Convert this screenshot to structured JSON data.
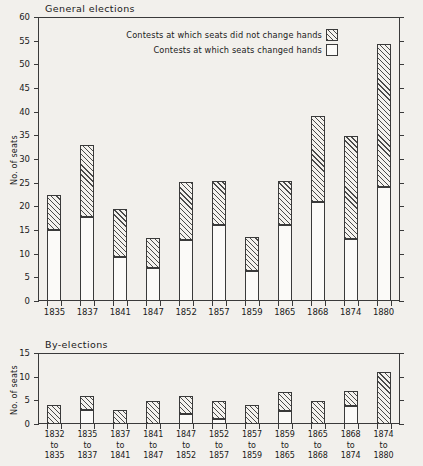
{
  "figure": {
    "background_color": "#f2f0ec",
    "ink_color": "#1a1a1a"
  },
  "legend": {
    "items": [
      {
        "label": "Contests at which seats did not change hands",
        "key": "hatched"
      },
      {
        "label": "Contests at which seats changed hands",
        "key": "open"
      }
    ]
  },
  "chart_data": [
    {
      "type": "bar",
      "subtype": "stacked",
      "title": "General elections",
      "xlabel": "",
      "ylabel": "No. of seats",
      "ylim": [
        0,
        60
      ],
      "yticks": [
        0,
        5,
        10,
        15,
        20,
        25,
        30,
        35,
        40,
        45,
        50,
        55,
        60
      ],
      "ytick_labels": [
        "0",
        "5",
        "10",
        "15",
        "20",
        "25",
        "30",
        "35",
        "40",
        "45",
        "50",
        "55",
        "60"
      ],
      "grid": false,
      "legend_position": "upper center",
      "categories": [
        "1835",
        "1837",
        "1841",
        "1847",
        "1852",
        "1857",
        "1859",
        "1865",
        "1868",
        "1874",
        "1880"
      ],
      "series": [
        {
          "name": "Contests at which seats changed hands",
          "style": "open",
          "values": [
            15,
            17.8,
            9.2,
            7,
            12.8,
            16,
            6.3,
            16,
            21,
            13,
            24
          ]
        },
        {
          "name": "Contests at which seats did not change hands",
          "style": "hatched",
          "values": [
            7.5,
            15.2,
            10.3,
            6.3,
            12.4,
            9.3,
            7.2,
            9.3,
            18,
            21.8,
            30.3
          ]
        }
      ],
      "totals": [
        22.5,
        33,
        19.5,
        13.3,
        25.2,
        25.3,
        13.5,
        25.3,
        39,
        34.8,
        54.3
      ]
    },
    {
      "type": "bar",
      "subtype": "stacked",
      "title": "By-elections",
      "xlabel": "",
      "ylabel": "No. of seats",
      "ylim": [
        0,
        15
      ],
      "yticks": [
        0,
        5,
        10,
        15
      ],
      "ytick_labels": [
        "0",
        "5",
        "10",
        "15"
      ],
      "grid": false,
      "categories": [
        "1832\nto\n1835",
        "1835\nto\n1837",
        "1837\nto\n1841",
        "1841\nto\n1847",
        "1847\nto\n1852",
        "1852\nto\n1857",
        "1857\nto\n1859",
        "1859\nto\n1865",
        "1865\nto\n1868",
        "1868\nto\n1874",
        "1874\nto\n1880"
      ],
      "category_lines": [
        [
          "1832",
          "to",
          "1835"
        ],
        [
          "1835",
          "to",
          "1837"
        ],
        [
          "1837",
          "to",
          "1841"
        ],
        [
          "1841",
          "to",
          "1847"
        ],
        [
          "1847",
          "to",
          "1852"
        ],
        [
          "1852",
          "to",
          "1857"
        ],
        [
          "1857",
          "to",
          "1859"
        ],
        [
          "1859",
          "to",
          "1865"
        ],
        [
          "1865",
          "to",
          "1868"
        ],
        [
          "1868",
          "to",
          "1874"
        ],
        [
          "1874",
          "to",
          "1880"
        ]
      ],
      "series": [
        {
          "name": "Contests at which seats changed hands",
          "style": "open",
          "values": [
            0,
            3,
            0,
            0,
            2.1,
            1,
            0,
            2.8,
            0,
            3.9,
            0
          ]
        },
        {
          "name": "Contests at which seats did not change hands",
          "style": "hatched",
          "values": [
            4,
            3,
            3,
            4.9,
            3.9,
            3.9,
            4,
            3.9,
            4.9,
            3.1,
            11
          ]
        }
      ],
      "totals": [
        4,
        6,
        3,
        4.9,
        6,
        4.9,
        4,
        6.7,
        4.9,
        7,
        11
      ]
    }
  ]
}
